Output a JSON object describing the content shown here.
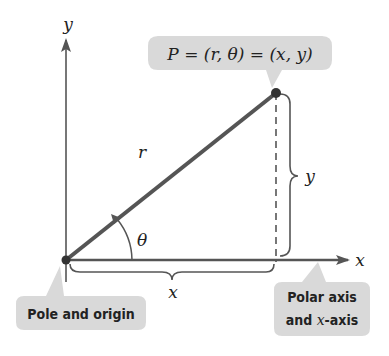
{
  "diagram": {
    "axes": {
      "y_label": "y",
      "x_label": "x"
    },
    "point_callout": {
      "text": "P = (r, θ) = (x, y)"
    },
    "segment_labels": {
      "r": "r",
      "theta": "θ",
      "x_brace": "x",
      "y_brace": "y"
    },
    "pole_callout": {
      "text": "Pole and origin"
    },
    "polar_axis_callout": {
      "line1": "Polar axis",
      "line2_prefix": "and ",
      "line2_var": "x",
      "line2_suffix": "-axis"
    },
    "colors": {
      "line": "#555555",
      "callout": "#d9d9d9",
      "text": "#222222"
    }
  }
}
